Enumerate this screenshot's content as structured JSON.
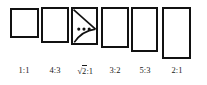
{
  "figure": {
    "background_color": "#ffffff",
    "stroke_color": "#111111",
    "label_color": "#1a1a1a"
  },
  "rectangles": [
    {
      "id": "rect-1-1",
      "ratio": "1:1",
      "width_px": 29,
      "height_px": 30,
      "x": 10,
      "y": 8,
      "has_construction": false
    },
    {
      "id": "rect-4-3",
      "ratio": "4:3",
      "width_px": 28,
      "height_px": 36,
      "x": 41,
      "y": 7,
      "has_construction": false
    },
    {
      "id": "rect-sqrt2-1",
      "ratio": "√2:1",
      "width_px": 27,
      "height_px": 38,
      "x": 71,
      "y": 7,
      "has_construction": true,
      "construction": {
        "diagonal": "top-left to mid-right",
        "arc": "quarter arc sweeping to left edge",
        "dots": 3
      }
    },
    {
      "id": "rect-3-2",
      "ratio": "3:2",
      "width_px": 28,
      "height_px": 41,
      "x": 101,
      "y": 7,
      "has_construction": false
    },
    {
      "id": "rect-5-3",
      "ratio": "5:3",
      "width_px": 27,
      "height_px": 45,
      "x": 131,
      "y": 7,
      "has_construction": false
    },
    {
      "id": "rect-2-1",
      "ratio": "2:1",
      "width_px": 29,
      "height_px": 52,
      "x": 162,
      "y": 7,
      "has_construction": false
    }
  ],
  "labels": [
    {
      "text": "1:1",
      "x": 4,
      "width": 40
    },
    {
      "text": "4:3",
      "x": 35,
      "width": 40
    },
    {
      "text": "√2:1",
      "x": 64,
      "width": 42
    },
    {
      "text": "3:2",
      "x": 95,
      "width": 40
    },
    {
      "text": "5:3",
      "x": 125,
      "width": 40
    },
    {
      "text": "2:1",
      "x": 156,
      "width": 42
    }
  ],
  "sqrt_label": {
    "radical_sign": "√",
    "radicand": "2",
    "suffix": ":1"
  }
}
